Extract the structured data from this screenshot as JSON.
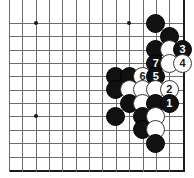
{
  "diagram": {
    "kind": "go-board-problem",
    "board": {
      "cols": 13,
      "rows": 11,
      "cell": 13.35,
      "origin_x": 9,
      "origin_y": 23,
      "line_color": "#6e6e6e",
      "edge_color": "#1a1a1a",
      "background": "#ffffff",
      "edges": {
        "right": true,
        "bottom": true
      },
      "star_points": [
        {
          "col": 2,
          "row": 0,
          "name": "star-point-top-left"
        },
        {
          "col": 2,
          "row": 7,
          "name": "star-point-bottom-left"
        },
        {
          "col": 9,
          "row": 0,
          "name": "star-point-top-right"
        }
      ]
    },
    "colors": {
      "black_stone": "#111111",
      "white_stone": "#ffffff",
      "white_stone_border": "#3a3a3a",
      "black_label": "#ffffff",
      "white_label": "#1a1a1a"
    },
    "stones": [
      {
        "col": 11,
        "row": 0,
        "color": "black",
        "label": ""
      },
      {
        "col": 12,
        "row": 1,
        "color": "black",
        "label": ""
      },
      {
        "col": 11,
        "row": 2,
        "color": "black",
        "label": ""
      },
      {
        "col": 12,
        "row": 2,
        "color": "white",
        "label": ""
      },
      {
        "col": 13,
        "row": 2,
        "color": "black",
        "label": "3"
      },
      {
        "col": 11,
        "row": 3,
        "color": "black",
        "label": "7"
      },
      {
        "col": 12,
        "row": 3,
        "color": "white",
        "label": ""
      },
      {
        "col": 13,
        "row": 3,
        "color": "white",
        "label": "4"
      },
      {
        "col": 8,
        "row": 4,
        "color": "black",
        "label": ""
      },
      {
        "col": 9,
        "row": 4,
        "color": "black",
        "label": ""
      },
      {
        "col": 10,
        "row": 4,
        "color": "white",
        "label": "6"
      },
      {
        "col": 11,
        "row": 4,
        "color": "black",
        "label": "5"
      },
      {
        "col": 8,
        "row": 5,
        "color": "black",
        "label": ""
      },
      {
        "col": 9,
        "row": 5,
        "color": "white",
        "label": ""
      },
      {
        "col": 10,
        "row": 5,
        "color": "white",
        "label": ""
      },
      {
        "col": 11,
        "row": 5,
        "color": "white",
        "label": ""
      },
      {
        "col": 12,
        "row": 5,
        "color": "white",
        "label": "2"
      },
      {
        "col": 9,
        "row": 6,
        "color": "black",
        "label": ""
      },
      {
        "col": 10,
        "row": 6,
        "color": "white",
        "label": ""
      },
      {
        "col": 11,
        "row": 6,
        "color": "black",
        "label": ""
      },
      {
        "col": 12,
        "row": 6,
        "color": "black",
        "label": "1"
      },
      {
        "col": 8,
        "row": 7,
        "color": "black",
        "label": ""
      },
      {
        "col": 10,
        "row": 7,
        "color": "black",
        "label": ""
      },
      {
        "col": 11,
        "row": 7,
        "color": "white",
        "label": ""
      },
      {
        "col": 10,
        "row": 8,
        "color": "black",
        "label": ""
      },
      {
        "col": 11,
        "row": 8,
        "color": "white",
        "label": ""
      },
      {
        "col": 11,
        "row": 9,
        "color": "black",
        "label": ""
      }
    ]
  }
}
